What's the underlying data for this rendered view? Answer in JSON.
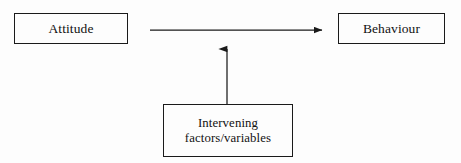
{
  "diagram": {
    "background_color": "#fdfdfd",
    "stroke_color": "#1a1a1a",
    "text_color": "#121212",
    "nodes": [
      {
        "id": "attitude",
        "label": "Attitude",
        "shape": "rectangle",
        "x": 14,
        "y": 13,
        "width": 114,
        "height": 31
      },
      {
        "id": "behaviour",
        "label": "Behaviour",
        "shape": "rectangle",
        "x": 338,
        "y": 13,
        "width": 107,
        "height": 31
      },
      {
        "id": "intervening",
        "label_line_1": "Intervening",
        "label_line_2": "factors/variables",
        "shape": "rectangle",
        "x": 163,
        "y": 104,
        "width": 130,
        "height": 53
      }
    ],
    "arrows": [
      {
        "id": "attitude-to-behaviour",
        "from": "attitude",
        "to": "behaviour",
        "direction": "right",
        "x1": 150,
        "y1": 30,
        "x2": 330,
        "y2": 30
      },
      {
        "id": "intervening-to-link",
        "from": "intervening",
        "to": "attitude-to-behaviour",
        "direction": "up",
        "x1": 227,
        "y1": 104,
        "x2": 227,
        "y2": 40
      }
    ]
  }
}
